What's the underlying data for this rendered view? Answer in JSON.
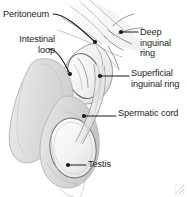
{
  "figure": {
    "type": "medical-line-drawing",
    "width": 187,
    "height": 197,
    "background_color": "#ffffff",
    "ink_color": "#231f20",
    "shading_color": "#d9d9d9"
  },
  "labels": {
    "peritoneum": "Peritoneum",
    "intestinal_loop_line1": "Intestinal",
    "intestinal_loop_line2": "loop",
    "deep_inguinal_ring_line1": "Deep",
    "deep_inguinal_ring_line2": "inguinal",
    "deep_inguinal_ring_line3": "ring",
    "superficial_inguinal_ring_line1": "Superficial",
    "superficial_inguinal_ring_line2": "inguinal ring",
    "spermatic_cord": "Spermatic cord",
    "testis": "Testis"
  },
  "leader_lines": [
    {
      "name": "peritoneum",
      "from": [
        53,
        15
      ],
      "to": [
        96,
        43
      ],
      "dot": [
        96,
        43
      ]
    },
    {
      "name": "intestinal-loop",
      "from": [
        48,
        50
      ],
      "to": [
        71,
        75
      ],
      "dot": [
        71,
        75
      ]
    },
    {
      "name": "deep-inguinal-ring",
      "from": [
        137,
        32
      ],
      "to": [
        121,
        32
      ],
      "dot": [
        121,
        32
      ]
    },
    {
      "name": "superficial-inguinal-ring",
      "from": [
        128,
        76
      ],
      "to": [
        100,
        76
      ],
      "dot": [
        100,
        76
      ]
    },
    {
      "name": "spermatic-cord",
      "from": [
        115,
        116
      ],
      "to": [
        84,
        116
      ],
      "dot": [
        84,
        116
      ]
    },
    {
      "name": "testis",
      "from": [
        85,
        165
      ],
      "to": [
        68,
        165
      ],
      "dot": [
        68,
        165
      ]
    }
  ],
  "resize_handle": {
    "icon": "resize-grip-icon",
    "position": "bottom-right"
  }
}
